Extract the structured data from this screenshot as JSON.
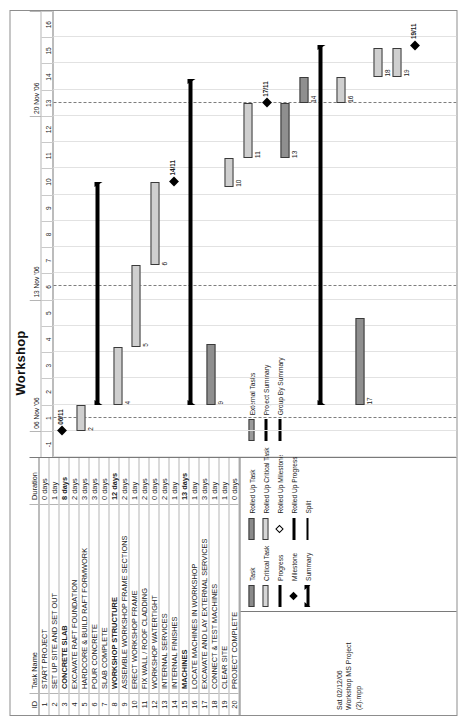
{
  "page": {
    "title": "Workshop"
  },
  "table": {
    "headers": {
      "id": "ID",
      "name": "Task Name",
      "duration": "Duration"
    },
    "rows": [
      {
        "id": "1",
        "name": "START PROJECT",
        "duration": "0 days",
        "bold": false
      },
      {
        "id": "2",
        "name": "SET UP SITE AND SET OUT",
        "duration": "1 day",
        "bold": false
      },
      {
        "id": "3",
        "name": "CONCRETE SLAB",
        "duration": "8 days",
        "bold": true
      },
      {
        "id": "4",
        "name": "EXCAVATE RAFT FOUNDATION",
        "duration": "2 days",
        "bold": false
      },
      {
        "id": "5",
        "name": "HARDCORE & BUILD RAFT FORMWORK",
        "duration": "3 days",
        "bold": false
      },
      {
        "id": "6",
        "name": "POUR CONCRETE",
        "duration": "3 days",
        "bold": false
      },
      {
        "id": "7",
        "name": "SLAB COMPLETE",
        "duration": "0 days",
        "bold": false
      },
      {
        "id": "8",
        "name": "WORKSHOP STRUCTURE",
        "duration": "12 days",
        "bold": true
      },
      {
        "id": "9",
        "name": "ASSEMBLE WORKSHOP FRAME SECTIONS",
        "duration": "2 days",
        "bold": false
      },
      {
        "id": "10",
        "name": "ERECT WORKSHOP FRAME",
        "duration": "1 day",
        "bold": false
      },
      {
        "id": "11",
        "name": "FIX WALL / ROOF CLADDING",
        "duration": "2 days",
        "bold": false
      },
      {
        "id": "12",
        "name": "WORKSHOP WATERTIGHT",
        "duration": "0 days",
        "bold": false
      },
      {
        "id": "13",
        "name": "INTERNAL SERVICES",
        "duration": "2 days",
        "bold": false
      },
      {
        "id": "14",
        "name": "INTERNAL FINISHES",
        "duration": "1 day",
        "bold": false
      },
      {
        "id": "15",
        "name": "MACHINES",
        "duration": "13 days",
        "bold": true
      },
      {
        "id": "16",
        "name": "LOCATE  MACHINES IN WORKSHOP",
        "duration": "1 day",
        "bold": false
      },
      {
        "id": "17",
        "name": "EXCAVATE AND LAY EXTERNAL SERVICES",
        "duration": "3 days",
        "bold": false
      },
      {
        "id": "18",
        "name": "CONNECT & TEST MACHINES",
        "duration": "1 day",
        "bold": false
      },
      {
        "id": "19",
        "name": "CLEAR SITE",
        "duration": "1 day",
        "bold": false
      },
      {
        "id": "20",
        "name": "PROJECT COMPLETE",
        "duration": "0 days",
        "bold": false
      }
    ]
  },
  "stamp": {
    "line1": "Sat 02/12/06",
    "line2": "Workshop MS Project",
    "line3": "(2).mpp"
  },
  "legend": {
    "columns": [
      [
        {
          "label": "Task",
          "symbol": "task-bar"
        },
        {
          "label": "Critical Task",
          "symbol": "critical-task-bar"
        },
        {
          "label": "Progress",
          "symbol": "progress-bar"
        },
        {
          "label": "Milestone",
          "symbol": "milestone-diamond"
        },
        {
          "label": "Summary",
          "symbol": "summary-bar"
        }
      ],
      [
        {
          "label": "Rolled Up Task",
          "symbol": "rolled-up-task-bar"
        },
        {
          "label": "Rolled Up Critical Task",
          "symbol": "rolled-up-critical-task-bar"
        },
        {
          "label": "Rolled Up Milestone",
          "symbol": "rolled-up-milestone-diamond"
        },
        {
          "label": "Rolled Up Progress",
          "symbol": "rolled-up-progress-bar"
        },
        {
          "label": "Split",
          "symbol": "split-line"
        }
      ],
      [
        {
          "label": "External Tasks",
          "symbol": "external-task-bar"
        },
        {
          "label": "Project Summary",
          "symbol": "project-summary-bar"
        },
        {
          "label": "Group By Summary",
          "symbol": "group-by-summary-bar"
        }
      ]
    ]
  },
  "chart_data": {
    "type": "bar",
    "title": "Workshop",
    "xlabel": "",
    "ylabel": "",
    "timescale": {
      "weeks": [
        {
          "label": "",
          "start": -1,
          "span": 2
        },
        {
          "label": "06 Nov '06",
          "start": 1,
          "span": 5
        },
        {
          "label": "13 Nov '06",
          "start": 6,
          "span": 7
        },
        {
          "label": "20 Nov '06",
          "start": 13,
          "span": 4
        }
      ],
      "days": [
        "-1",
        "1",
        "2",
        "3",
        "4",
        "5",
        "6",
        "7",
        "8",
        "9",
        "10",
        "11",
        "12",
        "13",
        "14",
        "15",
        "16"
      ],
      "axis_start": -1,
      "axis_end": 16
    },
    "tasks": [
      {
        "id": "1",
        "name": "START PROJECT",
        "duration": "0 days",
        "kind": "milestone",
        "start": 0,
        "end": 0,
        "label": "06/11"
      },
      {
        "id": "2",
        "name": "SET UP SITE AND SET OUT",
        "duration": "1 day",
        "kind": "task",
        "start": 0,
        "end": 1,
        "label": "2"
      },
      {
        "id": "3",
        "name": "CONCRETE SLAB",
        "duration": "8 days",
        "kind": "summary",
        "start": 1,
        "end": 9.5,
        "label": ""
      },
      {
        "id": "4",
        "name": "EXCAVATE RAFT FOUNDATION",
        "duration": "2 days",
        "kind": "task",
        "start": 1,
        "end": 3.2,
        "label": "4"
      },
      {
        "id": "5",
        "name": "HARDCORE & BUILD RAFT FORMWORK",
        "duration": "3 days",
        "kind": "task",
        "start": 3.2,
        "end": 6.3,
        "label": "5"
      },
      {
        "id": "6",
        "name": "POUR CONCRETE",
        "duration": "3 days",
        "kind": "task",
        "start": 6.3,
        "end": 9.5,
        "label": "6"
      },
      {
        "id": "7",
        "name": "SLAB COMPLETE",
        "duration": "0 days",
        "kind": "milestone",
        "start": 9.5,
        "end": 9.5,
        "label": "14/11"
      },
      {
        "id": "8",
        "name": "WORKSHOP STRUCTURE",
        "duration": "12 days",
        "kind": "summary",
        "start": 1,
        "end": 13.4,
        "label": ""
      },
      {
        "id": "9",
        "name": "ASSEMBLE WORKSHOP FRAME SECTIONS",
        "duration": "2 days",
        "kind": "critical",
        "start": 1,
        "end": 3.3,
        "label": "9"
      },
      {
        "id": "10",
        "name": "ERECT WORKSHOP FRAME",
        "duration": "1 day",
        "kind": "task",
        "start": 9.3,
        "end": 10.4,
        "label": "10"
      },
      {
        "id": "11",
        "name": "FIX WALL / ROOF CLADDING",
        "duration": "2 days",
        "kind": "task",
        "start": 10.4,
        "end": 12.5,
        "label": "11"
      },
      {
        "id": "12",
        "name": "WORKSHOP WATERTIGHT",
        "duration": "0 days",
        "kind": "milestone",
        "start": 12.5,
        "end": 12.5,
        "label": "17/11"
      },
      {
        "id": "13",
        "name": "INTERNAL SERVICES",
        "duration": "2 days",
        "kind": "critical",
        "start": 10.4,
        "end": 12.5,
        "label": "13"
      },
      {
        "id": "14",
        "name": "INTERNAL FINISHES",
        "duration": "1 day",
        "kind": "critical",
        "start": 12.5,
        "end": 13.5,
        "label": "14"
      },
      {
        "id": "15",
        "name": "MACHINES",
        "duration": "13 days",
        "kind": "summary",
        "start": 1,
        "end": 14.7,
        "label": ""
      },
      {
        "id": "16",
        "name": "LOCATE  MACHINES IN WORKSHOP",
        "duration": "1 day",
        "kind": "task",
        "start": 12.5,
        "end": 13.5,
        "label": "16"
      },
      {
        "id": "17",
        "name": "EXCAVATE AND LAY EXTERNAL SERVICES",
        "duration": "3 days",
        "kind": "critical",
        "start": 1,
        "end": 4.3,
        "label": "17"
      },
      {
        "id": "18",
        "name": "CONNECT & TEST MACHINES",
        "duration": "1 day",
        "kind": "task",
        "start": 13.5,
        "end": 14.6,
        "label": "18"
      },
      {
        "id": "19",
        "name": "CLEAR SITE",
        "duration": "1 day",
        "kind": "task",
        "start": 13.5,
        "end": 14.6,
        "label": "19"
      },
      {
        "id": "20",
        "name": "PROJECT COMPLETE",
        "duration": "0 days",
        "kind": "milestone",
        "start": 14.7,
        "end": 14.7,
        "label": "19/11"
      }
    ]
  }
}
